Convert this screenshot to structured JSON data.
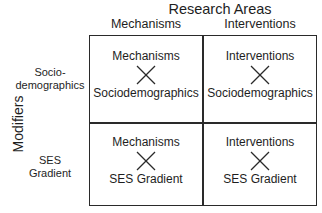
{
  "title": "Research Areas",
  "columns": [
    {
      "label": "Mechanisms"
    },
    {
      "label": "Interventions"
    }
  ],
  "axis_label": "Modifiers",
  "rows": [
    {
      "label_line1": "Socio-",
      "label_line2": "demographics"
    },
    {
      "label_line1": "SES",
      "label_line2": "Gradient"
    }
  ],
  "cells": [
    {
      "top": "Mechanisms",
      "operator": "cross-icon",
      "bottom": "Sociodemographics"
    },
    {
      "top": "Interventions",
      "operator": "cross-icon",
      "bottom": "Sociodemographics"
    },
    {
      "top": "Mechanisms",
      "operator": "cross-icon",
      "bottom": "SES Gradient"
    },
    {
      "top": "Interventions",
      "operator": "cross-icon",
      "bottom": "SES Gradient"
    }
  ],
  "colors": {
    "line": "#2a2a2a",
    "text": "#1e1e1e",
    "background": "#ffffff"
  }
}
